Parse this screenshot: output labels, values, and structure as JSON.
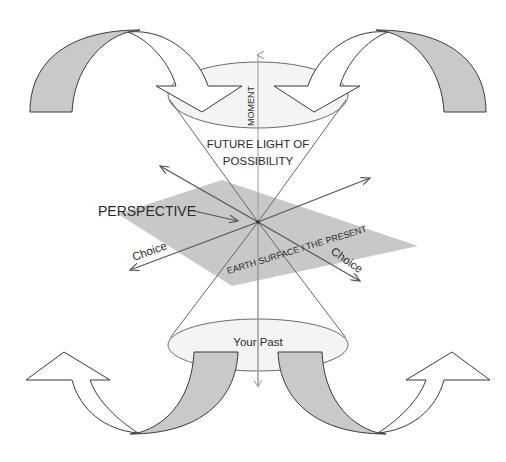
{
  "diagram": {
    "labels": {
      "moment": "MOMENT",
      "future_line1": "FUTURE LIGHT OF",
      "future_line2": "POSSIBILITY",
      "perspective": "PERSPECTIVE",
      "choice_left": "Choice",
      "choice_right": "Choice",
      "earth_surface": "EARTH SURFACE / THE PRESENT",
      "your_past": "Your Past"
    },
    "colors": {
      "background": "#ffffff",
      "plane_fill": "#c8c8c8",
      "band_fill": "#c9c9c9",
      "line": "#555555",
      "outline": "#3a3a3a",
      "text": "#2a2a2a"
    },
    "elements": [
      "top-left curved arrow (pointing down into future cone)",
      "top-right curved arrow (pointing down into future cone)",
      "future light cone (top ellipse + cone to center)",
      "past light cone (bottom ellipse + cone to center)",
      "present plane (gray parallelogram)",
      "vertical time axis",
      "two choice axes (diagonal arrows)",
      "perspective pointer arrow",
      "bottom-left curved arrow (pointing up-left)",
      "bottom-right curved arrow (pointing up-right)"
    ]
  }
}
